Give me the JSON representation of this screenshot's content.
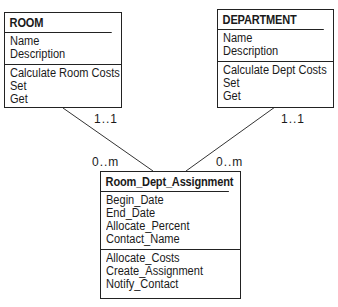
{
  "classes": {
    "room": {
      "name": "ROOM",
      "attributes": [
        "Name",
        "Description"
      ],
      "operations": [
        "Calculate Room Costs",
        "Set",
        "Get"
      ]
    },
    "department": {
      "name": "DEPARTMENT",
      "attributes": [
        "Name",
        "Description"
      ],
      "operations": [
        "Calculate Dept Costs",
        "Set",
        "Get"
      ]
    },
    "assignment": {
      "name": "Room_Dept_Assignment",
      "attributes": [
        "Begin_Date",
        "End_Date",
        "Allocate_Percent",
        "Contact_Name"
      ],
      "operations": [
        "Allocate_Costs",
        "Create_Assignment",
        "Notify_Contact"
      ]
    }
  },
  "associations": {
    "room_assignment": {
      "room_end": "1..1",
      "assignment_end": "0..m"
    },
    "department_assignment": {
      "department_end": "1..1",
      "assignment_end": "0..m"
    }
  }
}
